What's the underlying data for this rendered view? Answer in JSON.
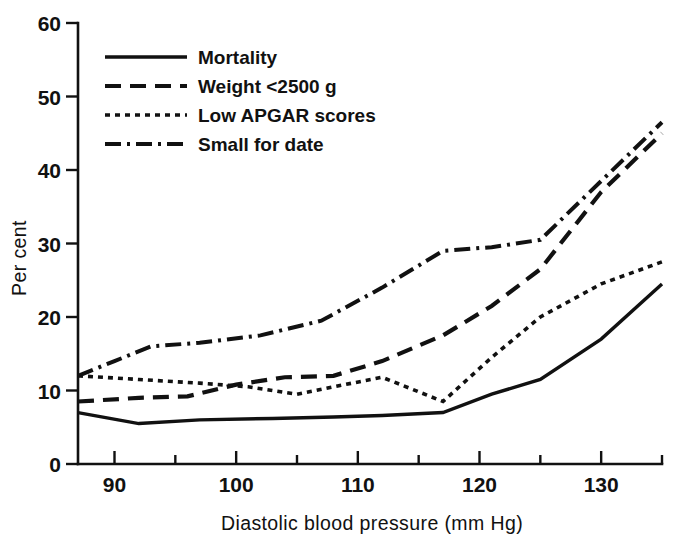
{
  "chart_data": {
    "type": "line",
    "title": "",
    "xlabel": "Diastolic blood pressure (mm Hg)",
    "ylabel": "Per cent",
    "xlim": [
      87,
      135
    ],
    "ylim": [
      0,
      60
    ],
    "grid": false,
    "legend_position": "top-left-inside",
    "x_ticks_major": [
      90,
      100,
      110,
      120,
      130
    ],
    "x_ticks_minor": [
      95,
      105,
      115,
      125,
      135
    ],
    "y_ticks": [
      0,
      10,
      20,
      30,
      40,
      50,
      60
    ],
    "series": [
      {
        "name": "Mortality",
        "style": "solid",
        "x": [
          87,
          92,
          97,
          103,
          108,
          112,
          117,
          121,
          125,
          130,
          135
        ],
        "values": [
          7.0,
          5.5,
          6.0,
          6.2,
          6.4,
          6.6,
          7.0,
          9.5,
          11.5,
          17.0,
          24.5
        ]
      },
      {
        "name": "Weight <2500 g",
        "style": "dashed",
        "x": [
          87,
          92,
          96,
          100,
          104,
          108,
          112,
          117,
          121,
          125,
          130,
          135
        ],
        "values": [
          8.5,
          9.0,
          9.2,
          10.8,
          11.8,
          12.0,
          14.0,
          17.5,
          21.5,
          26.5,
          37.0,
          45.0
        ]
      },
      {
        "name": "Low APGAR scores",
        "style": "dotted",
        "x": [
          87,
          92,
          97,
          101,
          105,
          108,
          112,
          117,
          121,
          125,
          130,
          135
        ],
        "values": [
          12.0,
          11.5,
          11.0,
          10.5,
          9.5,
          10.5,
          11.8,
          8.5,
          14.5,
          20.0,
          24.5,
          27.5
        ]
      },
      {
        "name": "Small for date",
        "style": "dash-dot",
        "x": [
          87,
          90,
          93,
          97,
          102,
          107,
          112,
          117,
          121,
          125,
          130,
          135
        ],
        "values": [
          12.0,
          14.0,
          16.0,
          16.5,
          17.5,
          19.5,
          24.0,
          29.0,
          29.5,
          30.5,
          38.5,
          46.5
        ]
      }
    ]
  },
  "legend": {
    "entries": [
      {
        "label": "Mortality",
        "style": "solid"
      },
      {
        "label": "Weight <2500 g",
        "style": "dashed"
      },
      {
        "label": "Low APGAR scores",
        "style": "dotted"
      },
      {
        "label": "Small for date",
        "style": "dash-dot"
      }
    ]
  },
  "axes": {
    "y_label": "Per cent",
    "x_label": "Diastolic blood pressure (mm Hg)",
    "y_tick_labels": [
      "0",
      "10",
      "20",
      "30",
      "40",
      "50",
      "60"
    ],
    "x_tick_labels": [
      "90",
      "100",
      "110",
      "120",
      "130"
    ]
  }
}
